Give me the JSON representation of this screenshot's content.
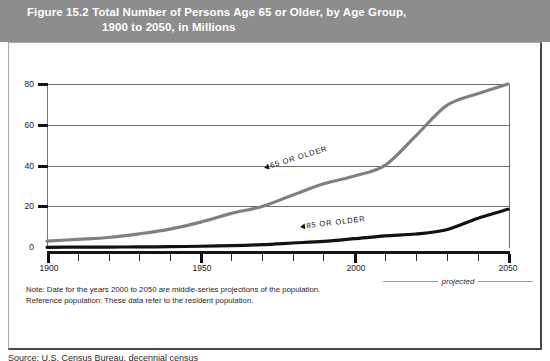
{
  "figure": {
    "label": "Figure 15.2",
    "title_line1": "Total Number of Persons Age 65 or Older, by Age Group,",
    "title_line2": "1900 to 2050, in Millions",
    "header_bg": "#8d8d8d",
    "header_fg": "#ffffff"
  },
  "notes": {
    "line1": "Note: Date for the years 2000 to 2050 are middle-series projections of the population.",
    "line2": "Reference population: These data refer to the resident population."
  },
  "projected": {
    "label": "projected"
  },
  "source": {
    "text": "Source: U.S. Census Bureau, decennial census"
  },
  "axes": {
    "y_ticks": [
      "0",
      "20",
      "40",
      "60",
      "80"
    ],
    "x_ticks_major": [
      "1900",
      "1950",
      "2000",
      "2050"
    ]
  },
  "callouts": {
    "series_65": "65 OR OLDER",
    "series_85": "85 OR OLDER"
  },
  "colors": {
    "series_65": "#808080",
    "series_85": "#111111",
    "gridline": "#6b6b6b",
    "axis": "#141414"
  },
  "chart_data": {
    "type": "line",
    "title": "Total Number of Persons Age 65 or Older, by Age Group, 1900 to 2050, in Millions",
    "xlabel": "",
    "ylabel": "Millions",
    "xlim": [
      1900,
      2050
    ],
    "ylim": [
      0,
      80
    ],
    "x": [
      1900,
      1910,
      1920,
      1930,
      1940,
      1950,
      1960,
      1970,
      1980,
      1990,
      2000,
      2010,
      2020,
      2030,
      2040,
      2050
    ],
    "grid": true,
    "legend_position": "inline-callout",
    "annotations": [
      "65 OR OLDER",
      "85 OR OLDER",
      "projected"
    ],
    "series": [
      {
        "name": "65 OR OLDER",
        "color": "#808080",
        "values": [
          3.1,
          4.0,
          4.9,
          6.7,
          9.0,
          12.4,
          16.7,
          20.1,
          25.7,
          31.2,
          35.0,
          40.2,
          54.6,
          69.4,
          75.2,
          80.0
        ]
      },
      {
        "name": "85 OR OLDER",
        "color": "#111111",
        "values": [
          0.1,
          0.2,
          0.2,
          0.3,
          0.4,
          0.6,
          0.9,
          1.4,
          2.2,
          3.0,
          4.3,
          5.7,
          6.6,
          8.7,
          14.2,
          18.7
        ]
      }
    ]
  }
}
